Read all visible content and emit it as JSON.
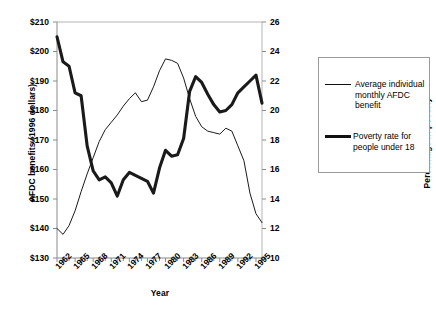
{
  "chart_data": {
    "type": "line",
    "title": "",
    "xlabel": "Year",
    "ylabel_left": "AFDC benefits (1996 dollars)",
    "ylabel_right": "Percentage in poverty",
    "x": [
      1962,
      1963,
      1964,
      1965,
      1966,
      1967,
      1968,
      1969,
      1970,
      1971,
      1972,
      1973,
      1974,
      1975,
      1976,
      1977,
      1978,
      1979,
      1980,
      1981,
      1982,
      1983,
      1984,
      1985,
      1986,
      1987,
      1988,
      1989,
      1990,
      1991,
      1992,
      1993,
      1994,
      1995,
      1996
    ],
    "xlim": [
      1962,
      1996
    ],
    "x_tick_labels": [
      "1962",
      "1965",
      "1968",
      "1971",
      "1974",
      "1977",
      "1980",
      "1983",
      "1986",
      "1989",
      "1992",
      "1995"
    ],
    "x_ticks": [
      1962,
      1965,
      1968,
      1971,
      1974,
      1977,
      1980,
      1983,
      1986,
      1989,
      1992,
      1995
    ],
    "ylim_left": [
      130,
      210
    ],
    "y_ticks_left": [
      130,
      140,
      150,
      160,
      170,
      180,
      190,
      200,
      210
    ],
    "y_tick_labels_left": [
      "$130",
      "$140",
      "$150",
      "$160",
      "$170",
      "$180",
      "$190",
      "$200",
      "$210"
    ],
    "ylim_right": [
      10,
      26
    ],
    "y_ticks_right": [
      10,
      12,
      14,
      16,
      18,
      20,
      22,
      24,
      26
    ],
    "y_tick_labels_right": [
      "10",
      "12",
      "14",
      "16",
      "18",
      "20",
      "22",
      "24",
      "26"
    ],
    "grid": false,
    "legend_position": "right-outside",
    "series": [
      {
        "name": "Average individual monthly AFDC benefit",
        "axis": "left",
        "style": "thin",
        "unit": "1996 dollars",
        "values": [
          140.0,
          138.0,
          141.0,
          146.0,
          152.5,
          158.5,
          164.0,
          169.5,
          173.5,
          176.0,
          178.5,
          181.5,
          184.0,
          186.0,
          183.0,
          183.5,
          188.0,
          193.5,
          197.5,
          197.0,
          196.0,
          191.0,
          184.0,
          178.0,
          174.5,
          173.0,
          172.5,
          172.0,
          174.0,
          173.0,
          168.0,
          163.0,
          152.0,
          145.0,
          142.0
        ]
      },
      {
        "name": "Poverty rate for people under 18",
        "axis": "right",
        "style": "thick",
        "unit": "percent",
        "values": [
          25.0,
          23.3,
          23.0,
          21.2,
          21.0,
          17.6,
          15.9,
          15.3,
          15.5,
          15.1,
          14.2,
          15.3,
          15.8,
          15.6,
          15.4,
          15.2,
          14.4,
          16.1,
          17.3,
          16.9,
          17.0,
          18.1,
          21.3,
          22.3,
          21.9,
          21.1,
          20.4,
          19.9,
          20.0,
          20.4,
          21.2,
          21.6,
          22.0,
          22.4,
          20.5
        ]
      }
    ]
  },
  "axes": {
    "x_title": "Year",
    "y_left_title": "AFDC benefits (1996 dollars)",
    "y_right_title": "Percentage in poverty"
  },
  "legend": {
    "items": [
      {
        "label": "Average individual monthly AFDC benefit",
        "style": "thin"
      },
      {
        "label": "Poverty rate for people under 18",
        "style": "thick"
      }
    ]
  }
}
